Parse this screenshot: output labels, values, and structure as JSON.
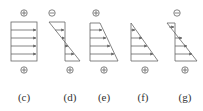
{
  "diagram": {
    "colors": {
      "stroke": "#555555",
      "arrow": "#666666",
      "text": "#333333"
    },
    "panels": [
      {
        "id": "c",
        "label": "(c)",
        "top_sign": "+",
        "bottom_sign": "+",
        "shape": "rectangle"
      },
      {
        "id": "d",
        "label": "(d)",
        "top_sign": "−",
        "bottom_sign": "+",
        "shape": "crossing-triangles"
      },
      {
        "id": "e",
        "label": "(e)",
        "top_sign": "+",
        "bottom_sign": "+",
        "shape": "trapezoid"
      },
      {
        "id": "f",
        "label": "(f)",
        "top_sign": "",
        "bottom_sign": "+",
        "shape": "triangle"
      },
      {
        "id": "g",
        "label": "(g)",
        "top_sign": "−",
        "bottom_sign": "+",
        "shape": "crossing-triangles-small-top"
      }
    ]
  }
}
